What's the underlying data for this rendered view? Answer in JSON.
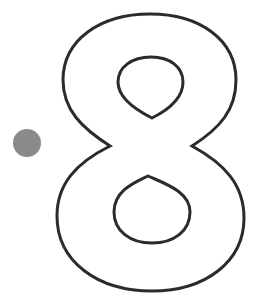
{
  "figure": {
    "label": "8",
    "colors": {
      "background": "#ffffff",
      "outline": "#2b2b2b",
      "dot": "#8a8a8a"
    },
    "dot": {
      "cx": 27,
      "cy": 143,
      "r": 14
    },
    "stroke_width": 3
  }
}
